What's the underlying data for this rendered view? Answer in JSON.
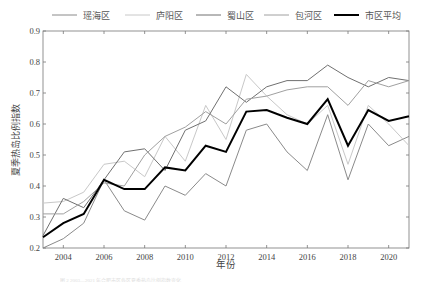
{
  "chart_data": {
    "type": "line",
    "title": "",
    "xlabel": "年份",
    "ylabel": "夏季热岛比例指数",
    "xlim": [
      2003,
      2021
    ],
    "ylim": [
      0.2,
      0.9
    ],
    "x_ticks": [
      2004,
      2006,
      2008,
      2010,
      2012,
      2014,
      2016,
      2018,
      2020
    ],
    "y_ticks": [
      0.2,
      0.3,
      0.4,
      0.5,
      0.6,
      0.7,
      0.8,
      0.9
    ],
    "grid": false,
    "legend_position": "top",
    "x": [
      2003,
      2004,
      2005,
      2006,
      2007,
      2008,
      2009,
      2010,
      2011,
      2012,
      2013,
      2014,
      2015,
      2016,
      2017,
      2018,
      2019,
      2020,
      2021
    ],
    "series": [
      {
        "name": "瑶海区",
        "color": "#8a8a8a",
        "width": 1,
        "values": [
          0.2,
          0.23,
          0.28,
          0.42,
          0.32,
          0.29,
          0.4,
          0.37,
          0.44,
          0.4,
          0.58,
          0.6,
          0.51,
          0.45,
          0.63,
          0.42,
          0.6,
          0.53,
          0.56
        ]
      },
      {
        "name": "庐阳区",
        "color": "#c8c8c8",
        "width": 1,
        "values": [
          0.345,
          0.35,
          0.38,
          0.47,
          0.48,
          0.43,
          0.56,
          0.48,
          0.66,
          0.55,
          0.76,
          0.69,
          0.63,
          0.6,
          0.66,
          0.47,
          0.66,
          0.6,
          0.53
        ]
      },
      {
        "name": "蜀山区",
        "color": "#707070",
        "width": 1,
        "values": [
          0.24,
          0.36,
          0.33,
          0.42,
          0.51,
          0.52,
          0.45,
          0.58,
          0.61,
          0.72,
          0.67,
          0.72,
          0.74,
          0.74,
          0.79,
          0.75,
          0.72,
          0.75,
          0.74
        ]
      },
      {
        "name": "包河区",
        "color": "#a0a0a0",
        "width": 1,
        "values": [
          0.31,
          0.31,
          0.35,
          0.41,
          0.4,
          0.5,
          0.56,
          0.59,
          0.64,
          0.6,
          0.68,
          0.69,
          0.71,
          0.72,
          0.72,
          0.66,
          0.74,
          0.72,
          0.74
        ]
      },
      {
        "name": "市区平均",
        "color": "#000000",
        "width": 2,
        "values": [
          0.235,
          0.28,
          0.31,
          0.42,
          0.39,
          0.39,
          0.46,
          0.45,
          0.53,
          0.51,
          0.64,
          0.645,
          0.62,
          0.6,
          0.68,
          0.53,
          0.645,
          0.61,
          0.625
        ]
      }
    ]
  },
  "caption": "图 2 2003—2021 年合肥市区各区夏季热岛比例指数变化"
}
